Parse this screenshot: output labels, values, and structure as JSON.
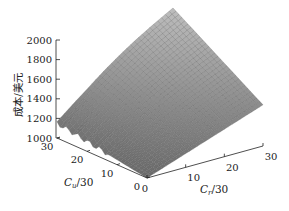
{
  "chart_data": {
    "type": "surface",
    "title": "",
    "zlabel": "成本/美元",
    "xlabel": "C_r/30",
    "ylabel": "C_u/30",
    "xlabel_main": "C",
    "xlabel_sub": "r",
    "xlabel_rest": "/30",
    "ylabel_main": "C",
    "ylabel_sub": "u",
    "ylabel_rest": "/30",
    "zlim": [
      1000,
      2000
    ],
    "xlim": [
      0,
      30
    ],
    "ylim": [
      0,
      30
    ],
    "z_ticks": [
      "1000",
      "1200",
      "1400",
      "1600",
      "1800",
      "2000"
    ],
    "x_ticks": [
      "0",
      "10",
      "20",
      "30"
    ],
    "y_ticks": [
      "0",
      "10",
      "20",
      "30"
    ],
    "grid": false,
    "surface_color": "#8c8c8c",
    "corner_values": {
      "Cr0_Cu0": 1000,
      "Cr30_Cu0": 1420,
      "Cr0_Cu30": 1150,
      "Cr30_Cu30": 2000
    }
  }
}
